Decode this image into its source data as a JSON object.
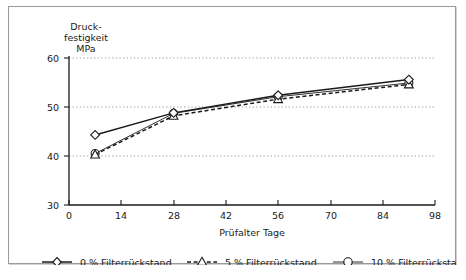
{
  "chart_data": {
    "type": "line",
    "title": "",
    "xlabel": "Prüfalter  Tage",
    "ylabel": "Druck-\nfestigkeit\nMPa",
    "ylabel_lines": [
      "Druck-",
      "festigkeit",
      "MPa"
    ],
    "xlim": [
      0,
      98
    ],
    "ylim": [
      30,
      60
    ],
    "xticks": [
      0,
      14,
      28,
      42,
      56,
      70,
      84,
      98
    ],
    "xtick_labels": [
      "0",
      "14",
      "28",
      "42",
      "56",
      "70",
      "84",
      "98"
    ],
    "yticks": [
      30,
      40,
      50,
      60
    ],
    "ytick_labels": [
      "30",
      "40",
      "50",
      "60"
    ],
    "grid": "horizontal-dotted",
    "gridlines_at": [
      40,
      50,
      60
    ],
    "legend_position": "bottom",
    "x": [
      7,
      28,
      56,
      91
    ],
    "series": [
      {
        "name": "0 % Filterrückstand",
        "marker": "diamond",
        "linestyle": "solid",
        "values": [
          44.3,
          48.8,
          52.4,
          55.6
        ]
      },
      {
        "name": "5 % Filterrückstand",
        "marker": "triangle",
        "linestyle": "dashed",
        "values": [
          40.3,
          48.2,
          51.6,
          54.6
        ]
      },
      {
        "name": "10 % Filterrückstand",
        "marker": "circle",
        "linestyle": "solid-thin",
        "values": [
          40.5,
          48.7,
          52.1,
          54.9
        ]
      }
    ]
  },
  "legend": {
    "items": [
      {
        "label": "0 % Filterrückstand",
        "marker": "diamond",
        "style": "solid"
      },
      {
        "label": "5 % Filterrückstand",
        "marker": "triangle",
        "style": "dashed"
      },
      {
        "label": "10 % Filterrückstand",
        "marker": "circle",
        "style": "solid-thin"
      }
    ]
  },
  "colors": {
    "line": "#1a1a1a",
    "grid": "#9a9a9a",
    "frame": "#9a9a9a",
    "background": "#ffffff"
  }
}
